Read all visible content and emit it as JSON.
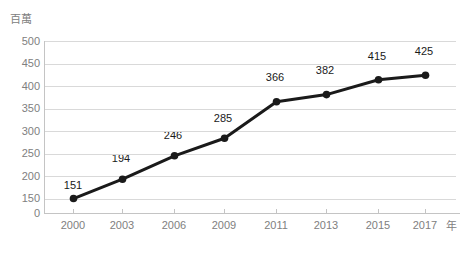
{
  "chart_data": {
    "type": "line",
    "title": "",
    "subtitle": "",
    "xlabel": "年",
    "ylabel": "百萬",
    "categories": [
      "2000",
      "2003",
      "2006",
      "2009",
      "2011",
      "2013",
      "2015",
      "2017"
    ],
    "values": [
      151,
      194,
      246,
      285,
      366,
      382,
      415,
      425
    ],
    "series": [
      {
        "name": "",
        "values": [
          151,
          194,
          246,
          285,
          366,
          382,
          415,
          425
        ]
      }
    ],
    "y_ticks": [
      "500",
      "450",
      "400",
      "350",
      "300",
      "250",
      "200",
      "150",
      "0"
    ],
    "y_tick_values": [
      500,
      450,
      400,
      350,
      300,
      250,
      200,
      150,
      0
    ],
    "ylim": [
      150,
      500
    ],
    "axis_break": true,
    "grid": true,
    "legend": "none",
    "data_labels": [
      "151",
      "194",
      "246",
      "285",
      "366",
      "382",
      "415",
      "425"
    ],
    "colors": {
      "line": "#1a1a1a",
      "marker": "#1a1a1a",
      "grid": "#d9d9d9",
      "axis": "#c4c4c4",
      "tick_text": "#808080",
      "label_text": "#1a1a1a",
      "background": "#ffffff"
    }
  }
}
